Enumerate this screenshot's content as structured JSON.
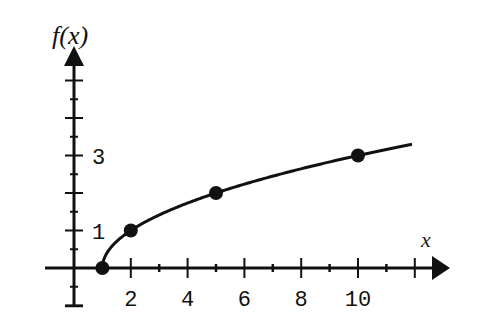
{
  "chart_data": {
    "type": "line",
    "title": "",
    "xlabel": "x",
    "ylabel": "f(x)",
    "function": "f(x) = sqrt(x - 1)",
    "x_ticks": [
      1,
      2,
      3,
      4,
      5,
      6,
      7,
      8,
      9,
      10,
      11,
      12
    ],
    "x_tick_labels": [
      "2",
      "4",
      "6",
      "8",
      "10"
    ],
    "x_tick_label_values": [
      2,
      4,
      6,
      8,
      10
    ],
    "y_ticks_major": [
      -1,
      1,
      2,
      3,
      4,
      5
    ],
    "y_ticks_minor": [
      -0.5,
      0.5,
      1.5,
      2.5,
      3.5,
      4.5
    ],
    "y_tick_labels": [
      "1",
      "3"
    ],
    "y_tick_label_values": [
      1,
      3
    ],
    "xlim": [
      -1,
      13.2
    ],
    "ylim": [
      -1,
      6
    ],
    "grid": false,
    "legend": null,
    "series": [
      {
        "name": "f(x)",
        "x": [
          1,
          2,
          5,
          10
        ],
        "values": [
          0,
          1,
          2,
          3
        ],
        "curve_end": [
          11.9,
          3.3
        ],
        "markers": true
      }
    ],
    "colors": {
      "line": "#111111",
      "axis": "#111111",
      "background": "#ffffff"
    }
  }
}
